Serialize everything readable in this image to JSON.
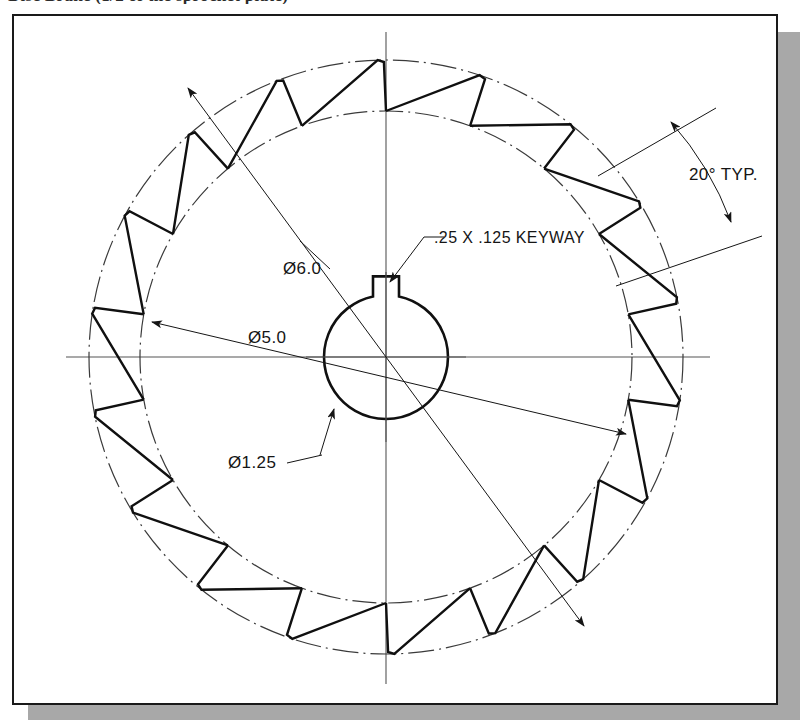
{
  "document": {
    "top_caption": "Disc Brake (1/2 of the sprocket plate)",
    "sheet_bg": "#ffffff",
    "frame_color": "#1a1a1a",
    "shadow_color": "#a8a8a8",
    "line_color": "#151515"
  },
  "drawing": {
    "title": "impeller-blade-plate",
    "view": "front-view",
    "center": {
      "x": 386,
      "y": 357
    },
    "circles": {
      "outer_pitch_radius": 297,
      "inner_pitch_radius": 246,
      "hub_radius": 62
    },
    "blades": {
      "count": 18,
      "pitch_angle_deg": 20
    },
    "keyway": {
      "width": 26,
      "depth": 20
    }
  },
  "annotations": [
    {
      "id": "dim-outer-diameter",
      "label": "Ø6.0",
      "x": 283,
      "y": 274,
      "kind": "diameter"
    },
    {
      "id": "dim-inner-diameter",
      "label": "Ø5.0",
      "x": 248,
      "y": 343,
      "kind": "diameter"
    },
    {
      "id": "dim-bore-diameter",
      "label": "Ø1.25",
      "x": 228,
      "y": 468,
      "kind": "diameter"
    },
    {
      "id": "note-keyway",
      "label": ".25 X .125 KEYWAY",
      "x": 434,
      "y": 243,
      "kind": "leader-note"
    },
    {
      "id": "dim-blade-angle",
      "label": "20° TYP.",
      "x": 689,
      "y": 180,
      "kind": "angular"
    }
  ]
}
